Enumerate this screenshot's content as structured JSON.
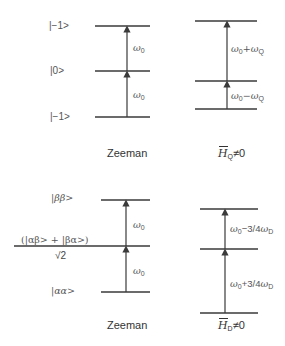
{
  "top": {
    "zeeman": {
      "states": [
        "|−1>",
        "|0>",
        "|−1>"
      ],
      "transitions": [
        {
          "symbol": "ω",
          "sub": "0"
        },
        {
          "symbol": "ω",
          "sub": "0"
        }
      ],
      "title": "Zeeman"
    },
    "quadrupole": {
      "transitions": [
        {
          "symbol": "ω",
          "sub": "0",
          "op": "+",
          "symbol2": "ω",
          "sub2": "Q"
        },
        {
          "symbol": "ω",
          "sub": "0",
          "op": "−",
          "symbol2": "ω",
          "sub2": "Q"
        }
      ],
      "title": {
        "H": "H",
        "sub": "Q",
        "rest": "≠0"
      }
    }
  },
  "bottom": {
    "zeeman": {
      "states": {
        "upper": "|ββ>",
        "middle_numerator": "(|αβ> + |βα>)",
        "middle_denominator": "√2",
        "lower": "|αα>"
      },
      "transitions": [
        {
          "symbol": "ω",
          "sub": "0"
        },
        {
          "symbol": "ω",
          "sub": "0"
        }
      ],
      "title": "Zeeman"
    },
    "dipolar": {
      "transitions": [
        {
          "symbol": "ω",
          "sub": "0",
          "op": "−3/4",
          "symbol2": "ω",
          "sub2": "D"
        },
        {
          "symbol": "ω",
          "sub": "0",
          "op": "+3/4",
          "symbol2": "ω",
          "sub2": "D"
        }
      ],
      "title": {
        "H": "H",
        "sub": "D",
        "rest": "≠0"
      }
    }
  }
}
